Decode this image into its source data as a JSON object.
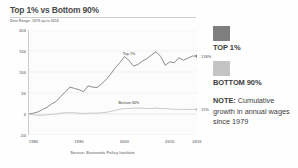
{
  "chart_title": "Top 1% vs Bottom 90%",
  "chart_subtitle": "Date Range: 1979 up to 2016",
  "source": "Source: Economic Policy Institute",
  "legend": {
    "items": [
      {
        "label": "TOP 1%",
        "color": "#7f7f7f",
        "swatch_name": "top-1-swatch"
      },
      {
        "label": "BOTTOM 90%",
        "color": "#c4c4c4",
        "swatch_name": "bottom-90-swatch"
      }
    ]
  },
  "note": {
    "label": "NOTE:",
    "text": " Cumulative growth in annual wages since 1979"
  },
  "inline_labels": {
    "top": "Top 1%",
    "bottom": "Bottom 90%"
  },
  "end_values": {
    "top": "138%",
    "bottom": "11%"
  },
  "chart_data": {
    "type": "line",
    "title": "Top 1% vs Bottom 90%",
    "subtitle": "Date Range: 1979 up to 2016",
    "xlabel": "",
    "ylabel": "",
    "xlim": [
      1979,
      2016
    ],
    "ylim": [
      -50,
      200
    ],
    "yticks": [
      200,
      150,
      100,
      50,
      0,
      -50
    ],
    "ytick_labels": [
      "200",
      "150",
      "100",
      "50",
      "0",
      "-50"
    ],
    "xticks": [
      1980,
      1990,
      2000,
      2010,
      2016
    ],
    "xtick_labels": [
      "1980",
      "1990",
      "2000",
      "2010",
      "2016"
    ],
    "grid": true,
    "legend_position": "right",
    "annotation": "NOTE: Cumulative growth in annual wages since 1979",
    "x": [
      1979,
      1980,
      1981,
      1982,
      1983,
      1984,
      1985,
      1986,
      1987,
      1988,
      1989,
      1990,
      1991,
      1992,
      1993,
      1994,
      1995,
      1996,
      1997,
      1998,
      1999,
      2000,
      2001,
      2002,
      2003,
      2004,
      2005,
      2006,
      2007,
      2008,
      2009,
      2010,
      2011,
      2012,
      2013,
      2014,
      2015,
      2016
    ],
    "series": [
      {
        "name": "Top 1%",
        "color": "#7f7f7f",
        "end_value": 138,
        "values": [
          0,
          2,
          5,
          11,
          16,
          24,
          30,
          42,
          52,
          64,
          61,
          58,
          53,
          67,
          64,
          63,
          72,
          82,
          95,
          110,
          122,
          137,
          128,
          114,
          118,
          126,
          132,
          141,
          148,
          137,
          116,
          124,
          122,
          134,
          128,
          133,
          138,
          138
        ]
      },
      {
        "name": "Bottom 90%",
        "color": "#c4c4c4",
        "end_value": 11,
        "values": [
          0,
          -2,
          -3,
          -3,
          -2,
          -1,
          0,
          2,
          3,
          3,
          3,
          2,
          1,
          2,
          2,
          2,
          3,
          4,
          6,
          9,
          11,
          13,
          13,
          14,
          14,
          14,
          13,
          13,
          14,
          13,
          13,
          12,
          11,
          11,
          11,
          11,
          11,
          11
        ]
      }
    ]
  }
}
